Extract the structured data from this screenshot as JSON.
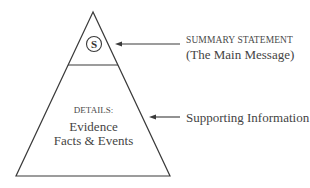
{
  "diagram": {
    "type": "inverted-pyramid",
    "summary_symbol": "S",
    "summary": {
      "title": "SUMMARY STATEMENT",
      "subtitle": "(The Main Message)"
    },
    "details": {
      "title": "DETAILS:",
      "line1": "Evidence",
      "line2": "Facts & Events"
    },
    "supporting_label": "Supporting Information",
    "colors": {
      "stroke": "#3a3a3a",
      "background": "#ffffff"
    }
  }
}
